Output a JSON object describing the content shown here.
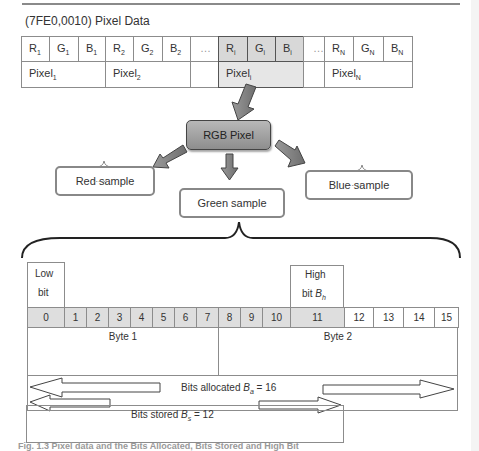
{
  "figure": {
    "title": "(7FE0,0010) Pixel Data",
    "caption": "Fig. 1.3  Pixel data and the Bits Allocated, Bits Stored and High Bit"
  },
  "pixel_table": {
    "samples": [
      {
        "base": "R",
        "sub": "1",
        "highlight": false
      },
      {
        "base": "G",
        "sub": "1",
        "highlight": false
      },
      {
        "base": "B",
        "sub": "1",
        "highlight": false
      },
      {
        "base": "R",
        "sub": "2",
        "highlight": false
      },
      {
        "base": "G",
        "sub": "2",
        "highlight": false
      },
      {
        "base": "B",
        "sub": "2",
        "highlight": false
      },
      {
        "base": "…",
        "sub": "",
        "highlight": false
      },
      {
        "base": "R",
        "sub": "i",
        "highlight": true
      },
      {
        "base": "G",
        "sub": "i",
        "highlight": true
      },
      {
        "base": "B",
        "sub": "i",
        "highlight": true
      },
      {
        "base": "…",
        "sub": "",
        "highlight": false
      },
      {
        "base": "R",
        "sub": "N",
        "highlight": false
      },
      {
        "base": "G",
        "sub": "N",
        "highlight": false
      },
      {
        "base": "B",
        "sub": "N",
        "highlight": false
      }
    ],
    "pixels": [
      {
        "base": "Pixel",
        "sub": "1"
      },
      {
        "base": "Pixel",
        "sub": "2"
      },
      {
        "base": "",
        "sub": ""
      },
      {
        "base": "Pixel",
        "sub": "i"
      },
      {
        "base": "",
        "sub": ""
      },
      {
        "base": "Pixel",
        "sub": "N"
      }
    ]
  },
  "tree": {
    "root": "RGB Pixel",
    "red": "Red sample",
    "green": "Green sample",
    "blue": "Blue sample",
    "ellipsis": "....."
  },
  "bits": {
    "low_bit": {
      "line1": "Low",
      "line2": "bit"
    },
    "high_bit": {
      "line1": "High",
      "line2": "bit ",
      "symbol": "B",
      "sub": "h"
    },
    "numbers": [
      "0",
      "1",
      "2",
      "3",
      "4",
      "5",
      "6",
      "7",
      "8",
      "9",
      "10",
      "11",
      "12",
      "13",
      "14",
      "15"
    ],
    "byte1": "Byte 1",
    "byte2": "Byte 2",
    "allocated": {
      "prefix": "Bits allocated ",
      "symbol": "B",
      "sub": "a",
      "suffix": " = 16"
    },
    "stored": {
      "prefix": "Bits stored ",
      "symbol": "B",
      "sub": "s",
      "suffix": " = 12"
    }
  }
}
